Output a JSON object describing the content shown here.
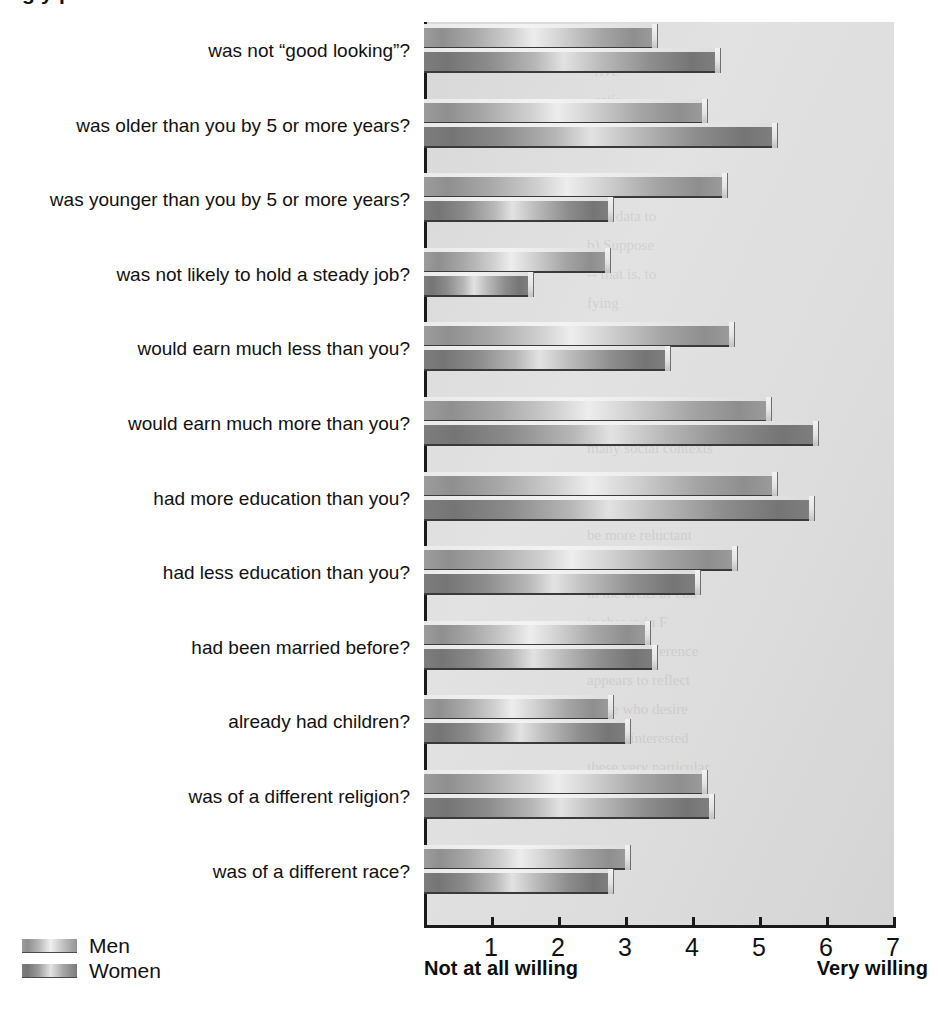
{
  "title_fragment": "g  y            p",
  "legend": {
    "position": "bottom-left",
    "entries": [
      {
        "label": "Men",
        "swatch": "men-swatch"
      },
      {
        "label": "Women",
        "swatch": "women-swatch"
      }
    ]
  },
  "axis": {
    "left_anchor_label": "Not at all willing",
    "right_anchor_label": "Very willing",
    "ticks": [
      "1",
      "2",
      "3",
      "4",
      "5",
      "6",
      "7"
    ]
  },
  "chart_data": {
    "type": "bar",
    "orientation": "horizontal",
    "title": "",
    "xlabel": "",
    "ylabel": "",
    "xlim": [
      0,
      7
    ],
    "grid": false,
    "legend_position": "bottom-left",
    "annotations": [
      "Not at all willing",
      "Very willing"
    ],
    "categories": [
      "was not “good looking”?",
      "was older than you by 5 or more years?",
      "was younger than you by 5 or more years?",
      "was not likely to hold a steady job?",
      "would earn much less than you?",
      "would earn much more than you?",
      "had more education than you?",
      "had less education than you?",
      "had been married before?",
      "already had children?",
      "was of a different religion?",
      "was of a different race?"
    ],
    "series": [
      {
        "name": "Men",
        "values": [
          3.4,
          4.15,
          4.45,
          2.7,
          4.55,
          5.1,
          5.2,
          4.6,
          3.3,
          2.75,
          4.15,
          3.0
        ]
      },
      {
        "name": "Women",
        "values": [
          4.35,
          5.2,
          2.75,
          1.55,
          3.6,
          5.8,
          5.75,
          4.05,
          3.4,
          3.0,
          4.25,
          2.75
        ]
      }
    ],
    "xtick_labels": [
      "1",
      "2",
      "3",
      "4",
      "5",
      "6",
      "7"
    ],
    "xticks": [
      1,
      2,
      3,
      4,
      5,
      6,
      7
    ]
  },
  "ghost_text": "that\n  rive\n  satis\ntion (Gray, 1\n\nIn the expe\nnew data to\nb) Suppose\n-- that is, to\nfying\n\nmodel\n\nwomen, unlike\nmany social contexts\nSewell, 1997). F\nas much more\nbe more reluctant\nthe age differences\nin the areas of edu\nis shown in F\nreveal a difference\nappears to reflect\nthose who desire\nwe are interested\nthese very particular\n"
}
